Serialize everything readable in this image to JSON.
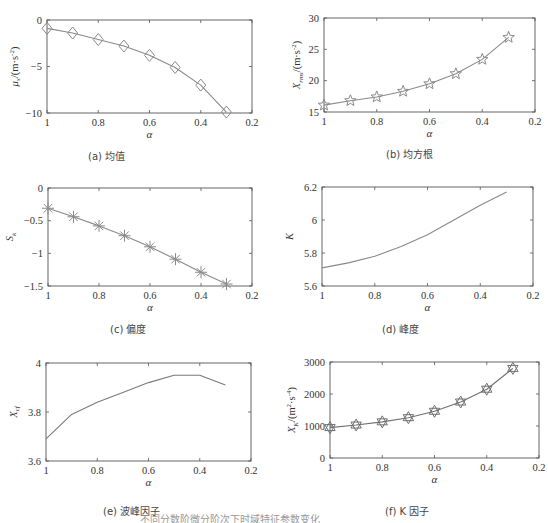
{
  "figure": {
    "bottom_caption": "不同分数阶微分阶次下时域特征参数变化"
  },
  "chart_data": [
    {
      "id": "a",
      "type": "line",
      "caption": "(a) 均值",
      "xlabel": "α",
      "ylabel": "μx/(m·s⁻²)",
      "ylabel_main": "μ",
      "ylabel_sub": "x",
      "ylabel_unit": "/(m·s",
      "ylabel_sup": "-2",
      "ylabel_end": ")",
      "x": [
        1.0,
        0.9,
        0.8,
        0.7,
        0.6,
        0.5,
        0.4,
        0.3
      ],
      "values": [
        -0.9,
        -1.4,
        -2.1,
        -2.8,
        -3.8,
        -5.1,
        -7.0,
        -9.9
      ],
      "xlim": [
        1,
        0.2
      ],
      "xticks": [
        1,
        0.8,
        0.6,
        0.4,
        0.2
      ],
      "xtick_labels": [
        "1",
        "0.8",
        "0.6",
        "0.4",
        "0.2"
      ],
      "ylim": [
        -10,
        0
      ],
      "yticks": [
        0,
        -5,
        -10
      ],
      "ytick_labels": [
        "0",
        "−5",
        "−10"
      ],
      "marker": "diamond",
      "x_reversed": true,
      "grid": false,
      "frame": {
        "left": 47,
        "top": 20,
        "right": 252,
        "bottom": 113
      },
      "caption_pos": {
        "left": 88,
        "top": 148
      }
    },
    {
      "id": "b",
      "type": "line",
      "caption": "(b) 均方根",
      "xlabel": "α",
      "ylabel": "Xrms/(m·s⁻²)",
      "ylabel_main": "X",
      "ylabel_sub": "rms",
      "ylabel_unit": "/(m·s",
      "ylabel_sup": "-2",
      "ylabel_end": ")",
      "x": [
        1.0,
        0.9,
        0.8,
        0.7,
        0.6,
        0.5,
        0.4,
        0.3
      ],
      "values": [
        16.1,
        16.8,
        17.4,
        18.3,
        19.5,
        21.1,
        23.4,
        26.9
      ],
      "xlim": [
        1,
        0.2
      ],
      "xticks": [
        1,
        0.8,
        0.6,
        0.4,
        0.2
      ],
      "xtick_labels": [
        "1",
        "0.8",
        "0.6",
        "0.4",
        "0.2"
      ],
      "ylim": [
        15,
        30
      ],
      "yticks": [
        30,
        25,
        20,
        15
      ],
      "ytick_labels": [
        "30",
        "25",
        "20",
        "15"
      ],
      "marker": "pentagram",
      "x_reversed": true,
      "grid": false,
      "frame": {
        "left": 324,
        "top": 18,
        "right": 535,
        "bottom": 112
      },
      "caption_pos": {
        "left": 386,
        "top": 146
      }
    },
    {
      "id": "c",
      "type": "line",
      "caption": "(c) 偏度",
      "xlabel": "α",
      "ylabel": "Sk",
      "ylabel_main": "S",
      "ylabel_sub": "k",
      "ylabel_unit": "",
      "ylabel_sup": "",
      "ylabel_end": "",
      "x": [
        1.0,
        0.9,
        0.8,
        0.7,
        0.6,
        0.5,
        0.4,
        0.3
      ],
      "values": [
        -0.31,
        -0.44,
        -0.58,
        -0.73,
        -0.9,
        -1.09,
        -1.29,
        -1.47
      ],
      "xlim": [
        1,
        0.2
      ],
      "xticks": [
        1,
        0.8,
        0.6,
        0.4,
        0.2
      ],
      "xtick_labels": [
        "1",
        "0.8",
        "0.6",
        "0.4",
        "0.2"
      ],
      "ylim": [
        -1.5,
        0
      ],
      "yticks": [
        0,
        -0.5,
        -1,
        -1.5
      ],
      "ytick_labels": [
        "0",
        "−0.5",
        "−1",
        "−1.5"
      ],
      "marker": "asterisk",
      "x_reversed": true,
      "grid": false,
      "frame": {
        "left": 48,
        "top": 188,
        "right": 252,
        "bottom": 286
      },
      "caption_pos": {
        "left": 110,
        "top": 321
      }
    },
    {
      "id": "d",
      "type": "line",
      "caption": "(d) 峰度",
      "xlabel": "α",
      "ylabel": "K",
      "ylabel_main": "K",
      "ylabel_sub": "",
      "ylabel_unit": "",
      "ylabel_sup": "",
      "ylabel_end": "",
      "x": [
        1.0,
        0.9,
        0.8,
        0.7,
        0.6,
        0.5,
        0.4,
        0.3
      ],
      "values": [
        5.71,
        5.74,
        5.78,
        5.84,
        5.91,
        6.0,
        6.09,
        6.17
      ],
      "xlim": [
        1,
        0.2
      ],
      "xticks": [
        1,
        0.8,
        0.6,
        0.4,
        0.2
      ],
      "xtick_labels": [
        "1",
        "0.8",
        "0.6",
        "0.4",
        "0.2"
      ],
      "ylim": [
        5.6,
        6.2
      ],
      "yticks": [
        6.2,
        6,
        5.8,
        5.6
      ],
      "ytick_labels": [
        "6.2",
        "6",
        "5.8",
        "5.6"
      ],
      "marker": "none",
      "x_reversed": true,
      "grid": false,
      "frame": {
        "left": 322,
        "top": 187,
        "right": 533,
        "bottom": 286
      },
      "caption_pos": {
        "left": 382,
        "top": 321
      }
    },
    {
      "id": "e",
      "type": "line",
      "caption": "(e) 波峰因子",
      "xlabel": "α",
      "ylabel": "Xcf",
      "ylabel_main": "X",
      "ylabel_sub": "cf",
      "ylabel_unit": "",
      "ylabel_sup": "",
      "ylabel_end": "",
      "x": [
        1.0,
        0.9,
        0.8,
        0.7,
        0.6,
        0.5,
        0.4,
        0.3
      ],
      "values": [
        3.69,
        3.79,
        3.84,
        3.88,
        3.92,
        3.95,
        3.95,
        3.91
      ],
      "xlim": [
        1,
        0.2
      ],
      "xticks": [
        1,
        0.8,
        0.6,
        0.4,
        0.2
      ],
      "xtick_labels": [
        "1",
        "0.8",
        "0.6",
        "0.4",
        "0.2"
      ],
      "ylim": [
        3.6,
        4.0
      ],
      "yticks": [
        4,
        3.8,
        3.6
      ],
      "ytick_labels": [
        "4",
        "3.8",
        "3.6"
      ],
      "marker": "none",
      "x_reversed": true,
      "grid": false,
      "frame": {
        "left": 46,
        "top": 363,
        "right": 251,
        "bottom": 461
      },
      "caption_pos": {
        "left": 103,
        "top": 503
      }
    },
    {
      "id": "f",
      "type": "line",
      "caption": "(f) K 因子",
      "xlabel": "α",
      "ylabel": "XK/(m²·s⁻⁴)",
      "ylabel_main": "X",
      "ylabel_sub": "K",
      "ylabel_unit": "/(m",
      "ylabel_sup": "2",
      "ylabel_mid": "·s",
      "ylabel_sup2": "-4",
      "ylabel_end": ")",
      "x": [
        1.0,
        0.9,
        0.8,
        0.7,
        0.6,
        0.5,
        0.4,
        0.3
      ],
      "values": [
        950,
        1030,
        1130,
        1260,
        1460,
        1750,
        2150,
        2800
      ],
      "xlim": [
        1,
        0.2
      ],
      "xticks": [
        1,
        0.8,
        0.6,
        0.4,
        0.2
      ],
      "xtick_labels": [
        "1",
        "0.8",
        "0.6",
        "0.4",
        "0.2"
      ],
      "ylim": [
        0,
        3000
      ],
      "yticks": [
        3000,
        2000,
        1000,
        0
      ],
      "ytick_labels": [
        "3000",
        "2000",
        "1000",
        "0"
      ],
      "marker": "hexagram",
      "x_reversed": true,
      "grid": false,
      "frame": {
        "left": 330,
        "top": 362,
        "right": 539,
        "bottom": 458
      },
      "caption_pos": {
        "left": 385,
        "top": 503
      }
    }
  ],
  "style": {
    "line_color": "#8a8a8a",
    "marker_color": "#8a8a8a",
    "axis_color": "#555555",
    "text_color": "#333333",
    "line_color_e": "#7a7a7a",
    "line_color_f": "#6f6f6f"
  }
}
